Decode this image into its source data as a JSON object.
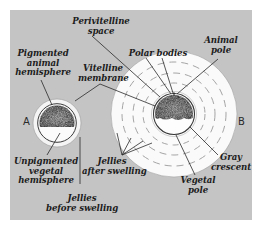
{
  "figure": {
    "background": "#c4c4c4",
    "panel_letters": {
      "a": "A",
      "b": "B"
    },
    "labels": {
      "perivitelline_space": [
        "Perivitelline",
        "space"
      ],
      "polar_bodies": [
        "Polar bodies"
      ],
      "animal_pole": [
        "Animal",
        "pole"
      ],
      "pigmented_animal_hemisphere": [
        "Pigmented",
        "animal",
        "hemisphere"
      ],
      "vitelline_membrane": [
        "Vitelline",
        "membrane"
      ],
      "unpigmented_vegetal_hemisphere": [
        "Unpigmented",
        "vegetal",
        "hemisphere"
      ],
      "jellies_after_swelling": [
        "Jellies",
        "after swelling"
      ],
      "jellies_before_swelling": [
        "Jellies",
        "before swelling"
      ],
      "gray_crescent": [
        "Gray",
        "crescent"
      ],
      "vegetal_pole": [
        "Vegetal",
        "pole"
      ]
    }
  }
}
